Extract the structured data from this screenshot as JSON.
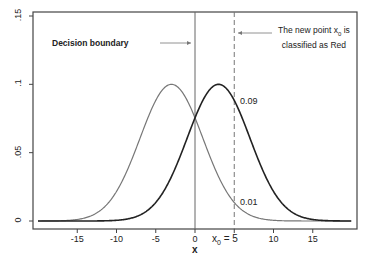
{
  "chart_data": {
    "type": "line",
    "title": "",
    "xlabel": "x",
    "ylabel": "",
    "xlim": [
      -20,
      20
    ],
    "ylim": [
      0,
      0.15
    ],
    "x_ticks": [
      -15,
      -10,
      -5,
      0,
      5,
      10,
      15
    ],
    "x_tick_labels": [
      "-15",
      "-10",
      "-5",
      "0",
      "x0 = 5",
      "10",
      "15"
    ],
    "y_ticks": [
      0,
      0.05,
      0.1,
      0.15
    ],
    "y_tick_labels": [
      "0",
      ".05",
      ".1",
      ".15"
    ],
    "grid": false,
    "series": [
      {
        "name": "Class A (gray)",
        "color": "#777777",
        "distribution": "normal",
        "mean": -3,
        "sd": 4,
        "peak": 0.1
      },
      {
        "name": "Class Red (black)",
        "color": "#222222",
        "distribution": "normal",
        "mean": 3,
        "sd": 4,
        "peak": 0.1
      }
    ],
    "vertical_lines": [
      {
        "x": 0,
        "style": "solid",
        "label": "Decision boundary"
      },
      {
        "x": 5,
        "style": "dashed",
        "label": "The new point x0 is classified as Red"
      }
    ],
    "annotations": [
      {
        "text": "Decision boundary",
        "points_to_x": 0
      },
      {
        "text": "The new point x0 is classified as Red",
        "points_to_x": 5
      },
      {
        "text": "0.09",
        "x": 5,
        "y": 0.09
      },
      {
        "text": "0.01",
        "x": 5,
        "y": 0.01
      }
    ]
  },
  "labels": {
    "boundary": "Decision boundary",
    "newpoint_line1": "The new point x",
    "newpoint_sub": "0",
    "newpoint_line1_end": " is",
    "newpoint_line2": "classified as Red",
    "val_high": "0.09",
    "val_low": "0.01",
    "xlabel": "x",
    "x0_prefix": "x",
    "x0_sub": "0",
    "x0_eq": " = 5"
  }
}
